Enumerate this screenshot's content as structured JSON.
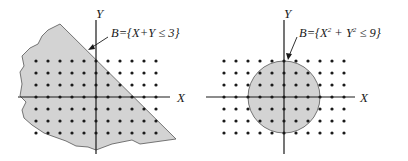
{
  "diagrams": [
    {
      "id": "half-plane",
      "set_label": "B={X+Y ≤ 3}",
      "axis_x_label": "X",
      "axis_y_label": "Y",
      "grid_x_range": [
        -5,
        5
      ],
      "grid_y_range": [
        -3,
        3
      ],
      "condition": "x + y <= 3"
    },
    {
      "id": "disc",
      "set_label_prefix": "B={X",
      "set_label_sup1": "2",
      "set_label_mid": " + Y",
      "set_label_sup2": "2",
      "set_label_suffix": " ≤ 9}",
      "axis_x_label": "X",
      "axis_y_label": "Y",
      "grid_x_range": [
        -5,
        5
      ],
      "grid_y_range": [
        -3,
        3
      ],
      "condition": "x^2 + y^2 <= 9"
    }
  ],
  "colors": {
    "region_fill": "#d3d3d3",
    "region_stroke": "#555555",
    "axis": "#1a1a1a",
    "dot": "#1a1a1a"
  }
}
